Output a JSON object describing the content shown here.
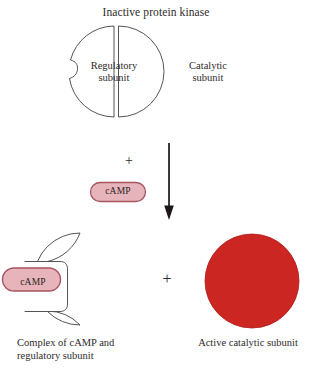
{
  "figure": {
    "title": "Inactive protein kinase",
    "background_color": "#ffffff",
    "stroke_color": "#45403f",
    "text_color": "#2e2b2b"
  },
  "top_complex": {
    "title": "Inactive protein kinase",
    "regulatory_subunit": {
      "label_line1": "Regulatory",
      "label_line2": "subunit",
      "fill": "#ffffff",
      "stroke": "#45403f"
    },
    "catalytic_subunit": {
      "label_line1": "Catalytic",
      "label_line2": "subunit",
      "fill": "#ffffff",
      "stroke": "#45403f"
    }
  },
  "reaction": {
    "plus_symbol": "+",
    "ligand": {
      "label": "cAMP",
      "fill": "#e6b4ba",
      "stroke": "#a8545f"
    },
    "arrow": {
      "direction": "down",
      "color": "#1b1717"
    }
  },
  "products": {
    "plus_symbol": "+",
    "complex": {
      "bound_ligand_label": "cAMP",
      "ligand_fill": "#e6b4ba",
      "ligand_stroke": "#a8545f",
      "caption_line1": "Complex of cAMP and",
      "caption_line2": "regulatory subunit",
      "fill": "#ffffff",
      "stroke": "#45403f"
    },
    "catalytic": {
      "caption": "Active catalytic subunit",
      "fill": "#cc2622",
      "stroke": "#b01d19"
    }
  }
}
